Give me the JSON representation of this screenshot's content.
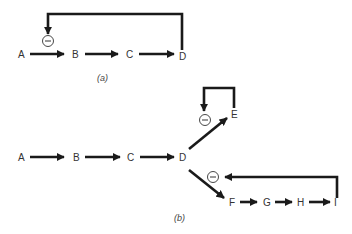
{
  "diagram_a": {
    "caption": "(a)",
    "nodes": [
      "A",
      "B",
      "C",
      "D"
    ],
    "edges": [
      [
        "A",
        "B"
      ],
      [
        "B",
        "C"
      ],
      [
        "C",
        "D"
      ]
    ],
    "feedback": {
      "from": "D",
      "to": "A→B",
      "sign": "−",
      "type": "inhibition"
    }
  },
  "diagram_b": {
    "caption": "(b)",
    "nodes": [
      "A",
      "B",
      "C",
      "D",
      "E",
      "F",
      "G",
      "H",
      "I"
    ],
    "edges": [
      [
        "A",
        "B"
      ],
      [
        "B",
        "C"
      ],
      [
        "C",
        "D"
      ],
      [
        "D",
        "E"
      ],
      [
        "D",
        "F"
      ],
      [
        "F",
        "G"
      ],
      [
        "G",
        "H"
      ],
      [
        "H",
        "I"
      ]
    ],
    "feedback": [
      {
        "from": "E",
        "to": "D→E",
        "sign": "−",
        "type": "inhibition"
      },
      {
        "from": "I",
        "to": "D→F",
        "sign": "−",
        "type": "inhibition"
      }
    ]
  },
  "minus_symbol": "−"
}
